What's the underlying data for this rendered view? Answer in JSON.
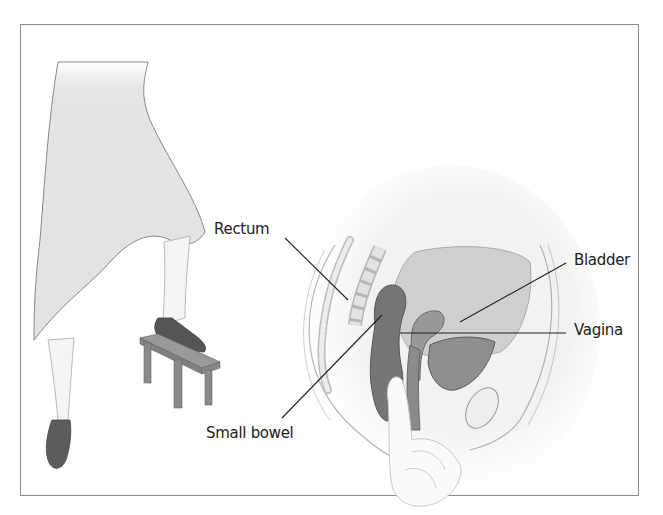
{
  "figure": {
    "labels": {
      "rectum": "Rectum",
      "bladder": "Bladder",
      "vagina": "Vagina",
      "small_bowel": "Small bowel"
    }
  }
}
